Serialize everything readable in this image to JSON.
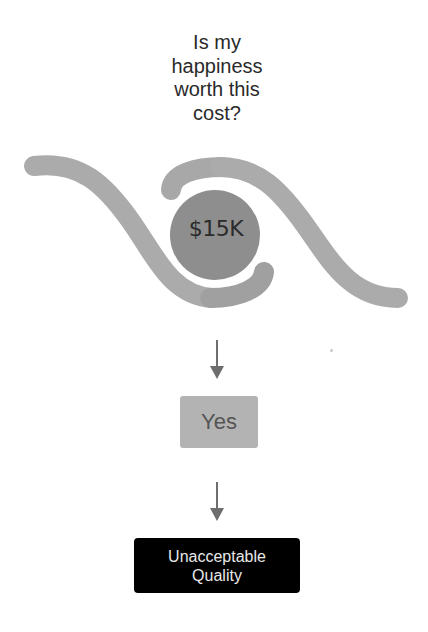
{
  "question": {
    "lines": [
      "Is my",
      "happiness",
      "worth this",
      "cost?"
    ]
  },
  "eye": {
    "cost_label": "$15K",
    "colors": {
      "wave": "#ababab",
      "wave_overlap": "#a0a0a0",
      "circle": "#8e8e8e"
    }
  },
  "flow": {
    "answer_label": "Yes",
    "result": {
      "line1": "Unacceptable",
      "line2": "Quality"
    },
    "colors": {
      "answer_box": "#b3b3b3",
      "result_box": "#000000",
      "arrow": "#6e6e6e"
    }
  }
}
